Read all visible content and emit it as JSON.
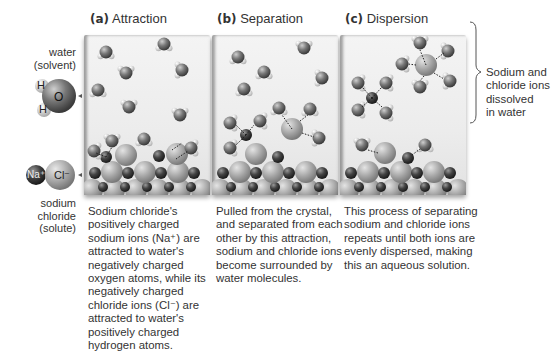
{
  "panels": [
    {
      "letter": "(a)",
      "title": "Attraction",
      "caption_lines": [
        "Sodium chloride's",
        "positively charged",
        "sodium ions (Na⁺) are",
        "attracted to water's",
        "negatively charged",
        "oxygen atoms,  while its",
        "negatively charged",
        "chloride ions (Cl⁻) are",
        "attracted to water's",
        "positively charged",
        "hydrogen atoms."
      ]
    },
    {
      "letter": "(b)",
      "title": "Separation",
      "caption_lines": [
        "Pulled from the crystal,",
        "and separated from each",
        "other by this attraction,",
        "sodium and chloride ions",
        "become surrounded by",
        "water molecules."
      ]
    },
    {
      "letter": "(c)",
      "title": "Dispersion",
      "caption_lines": [
        "This process of separating",
        "sodium and chloride ions",
        "repeats until both ions are",
        "evenly dispersed, making",
        "this an aqueous solution."
      ]
    }
  ],
  "legend": {
    "water_label_1": "water",
    "water_label_2": "(solvent)",
    "hydrogen_symbol": "H",
    "oxygen_symbol": "O",
    "sodium_symbol": "Na⁺",
    "chloride_symbol": "Cl⁻",
    "solute_label_1": "sodium",
    "solute_label_2": "chloride",
    "solute_label_3": "(solute)"
  },
  "dissolved_label_lines": [
    "Sodium and",
    "chloride ions",
    "dissolved",
    "in water"
  ],
  "colors": {
    "oxygen": "#6e6e6e",
    "sodium": "#3c3c3c",
    "chloride": "#a9a9a9",
    "hydrogen": "#e6e6e6",
    "text": "#333333"
  }
}
